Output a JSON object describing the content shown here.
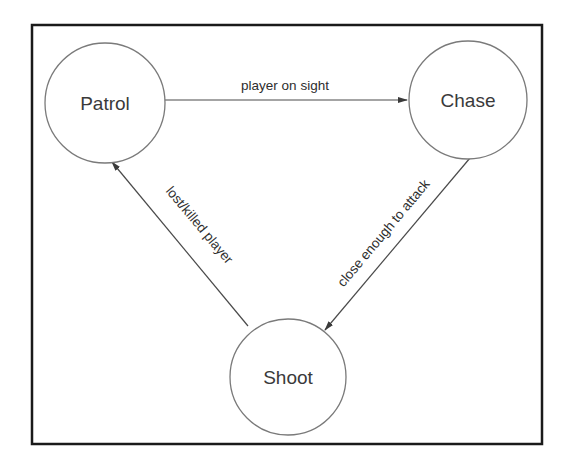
{
  "diagram": {
    "type": "state-machine",
    "states": [
      {
        "id": "patrol",
        "label": "Patrol",
        "cx": 105,
        "cy": 103,
        "r": 60
      },
      {
        "id": "chase",
        "label": "Chase",
        "cx": 468,
        "cy": 100,
        "r": 59
      },
      {
        "id": "shoot",
        "label": "Shoot",
        "cx": 288,
        "cy": 377,
        "r": 58
      }
    ],
    "transitions": [
      {
        "from": "patrol",
        "to": "chase",
        "label": "player on sight"
      },
      {
        "from": "chase",
        "to": "shoot",
        "label": "close enough to attack"
      },
      {
        "from": "shoot",
        "to": "patrol",
        "label": "lost/killed player"
      }
    ]
  },
  "colors": {
    "frame": "#1a1a1a",
    "circle": "#7a7a7a",
    "line": "#4a4a4a",
    "text": "#3a3a3a"
  }
}
